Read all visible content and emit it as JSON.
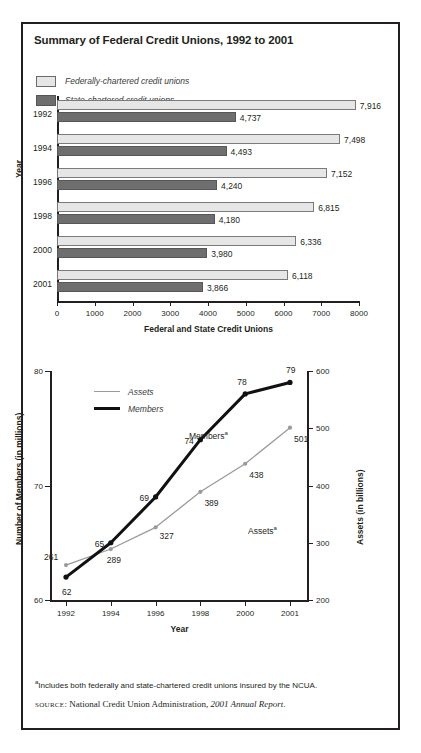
{
  "title": "Summary of Federal Credit Unions, 1992 to 2001",
  "bar_legend": [
    {
      "key": "federal",
      "label": "Federally-chartered credit unions",
      "color": "#e6e6e6"
    },
    {
      "key": "state",
      "label": "State-chartered credit unions",
      "color": "#6e6e6e"
    }
  ],
  "line_legend": [
    {
      "key": "assets",
      "label": "Assets",
      "color": "#9a9a9a"
    },
    {
      "key": "members",
      "label": "Members",
      "color": "#111111"
    }
  ],
  "annotations": {
    "members_series_label": "Members",
    "assets_series_label": "Assets",
    "footnote_marker": "a"
  },
  "footnote": "Includes both federally and state-chartered credit unions insured by the NCUA.",
  "source_prefix": "SOURCE",
  "source_text": ": National Credit Union Administration, ",
  "source_italic": "2001 Annual Report",
  "source_end": ".",
  "chart_data": [
    {
      "type": "bar",
      "orientation": "horizontal",
      "title": "Summary of Federal Credit Unions, 1992 to 2001",
      "xlabel": "Federal and State Credit Unions",
      "ylabel": "Year",
      "xlim": [
        0,
        8000
      ],
      "xticks": [
        0,
        1000,
        2000,
        3000,
        4000,
        5000,
        6000,
        7000,
        8000
      ],
      "xticklabels": [
        "0",
        "1000",
        "2000",
        "3000",
        "4000",
        "5000",
        "6000",
        "7000",
        "8000"
      ],
      "categories": [
        "1992",
        "1994",
        "1996",
        "1998",
        "2000",
        "2001"
      ],
      "grid": false,
      "legend_position": "top-left",
      "series": [
        {
          "name": "Federally-chartered credit unions",
          "color": "#e6e6e6",
          "values": [
            7916,
            7498,
            7152,
            6815,
            6336,
            6118
          ],
          "labels": [
            "7,916",
            "7,498",
            "7,152",
            "6,815",
            "6,336",
            "6,118"
          ]
        },
        {
          "name": "State-chartered credit unions",
          "color": "#6e6e6e",
          "values": [
            4737,
            4493,
            4240,
            4180,
            3980,
            3866
          ],
          "labels": [
            "4,737",
            "4,493",
            "4,240",
            "4,180",
            "3,980",
            "3,866"
          ]
        }
      ]
    },
    {
      "type": "line",
      "xlabel": "Year",
      "ylabel_left": "Number of Members (in millions)",
      "ylabel_right": "Assets (in billions)",
      "x": [
        "1992",
        "1994",
        "1996",
        "1998",
        "2000",
        "2001"
      ],
      "ylim_left": [
        60,
        80
      ],
      "yticks_left": [
        60,
        70,
        80
      ],
      "yticklabels_left": [
        "60",
        "70",
        "80"
      ],
      "ylim_right": [
        200,
        600
      ],
      "yticks_right": [
        200,
        300,
        400,
        500,
        600
      ],
      "yticklabels_right": [
        "200",
        "300",
        "400",
        "500",
        "600"
      ],
      "grid": false,
      "legend_position": "top-left",
      "series": [
        {
          "name": "Members",
          "axis": "left",
          "color": "#111111",
          "values": [
            62,
            65,
            69,
            74,
            78,
            79
          ],
          "labels": [
            "62",
            "65",
            "69",
            "74",
            "78",
            "79"
          ]
        },
        {
          "name": "Assets",
          "axis": "right",
          "color": "#9a9a9a",
          "values": [
            261,
            289,
            327,
            389,
            438,
            501
          ],
          "labels": [
            "261",
            "289",
            "327",
            "389",
            "438",
            "501"
          ]
        }
      ]
    }
  ]
}
